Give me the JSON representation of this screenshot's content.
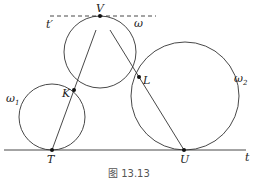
{
  "figure": {
    "caption": "图 13.13",
    "colors": {
      "stroke": "#333333",
      "text": "#222222",
      "background": "#ffffff"
    }
  },
  "lines": {
    "t": {
      "label": "t",
      "style": "solid"
    },
    "t_prime": {
      "label": "t′",
      "style": "dashed"
    }
  },
  "circles": {
    "omega": {
      "label": "ω",
      "sub": ""
    },
    "omega1": {
      "label": "ω",
      "sub": "1"
    },
    "omega2": {
      "label": "ω",
      "sub": "2"
    }
  },
  "points": {
    "V": "V",
    "K": "K",
    "L": "L",
    "T": "T",
    "U": "U"
  }
}
